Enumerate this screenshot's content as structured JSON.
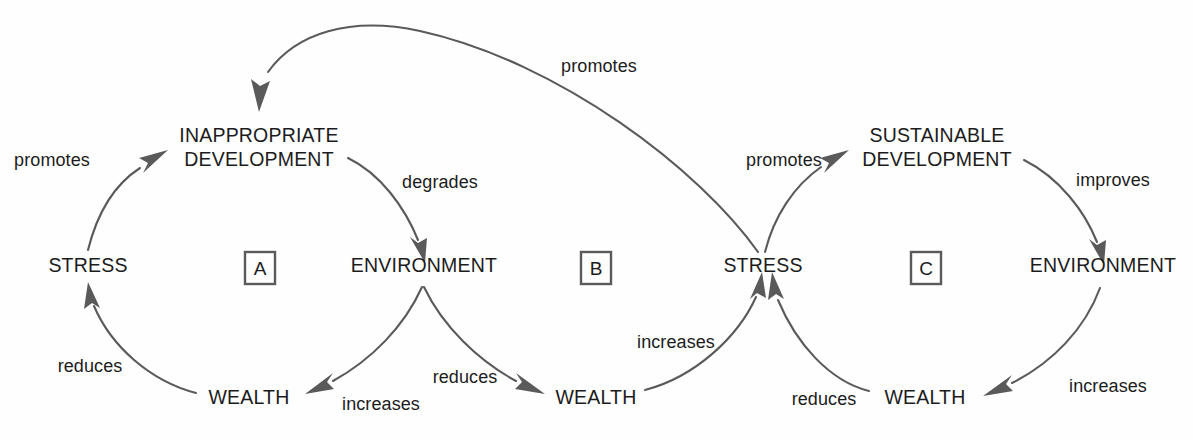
{
  "diagram": {
    "type": "causal-loop-diagram",
    "line_color": "#5a5a5a",
    "text_color": "#1c1c1c",
    "background_color": "#fefefe"
  },
  "nodes": {
    "stress_left": "STRESS",
    "inappropriate_development_line1": "INAPPROPRIATE",
    "inappropriate_development_line2": "DEVELOPMENT",
    "environment_left": "ENVIRONMENT",
    "wealth_left": "WEALTH",
    "wealth_middle": "WEALTH",
    "stress_middle": "STRESS",
    "sustainable_development_line1": "SUSTAINABLE",
    "sustainable_development_line2": "DEVELOPMENT",
    "environment_right": "ENVIRONMENT",
    "wealth_right": "WEALTH"
  },
  "loops": {
    "a": "A",
    "b": "B",
    "c": "C"
  },
  "edges": {
    "stress_left_to_inappropriate": "promotes",
    "inappropriate_to_environment_left": "degrades",
    "environment_left_to_wealth_left": "increases",
    "wealth_left_to_stress_left": "reduces",
    "environment_left_to_wealth_middle": "reduces",
    "wealth_middle_to_stress_middle": "increases",
    "stress_middle_to_inappropriate": "promotes",
    "stress_middle_to_sustainable": "promotes",
    "sustainable_to_environment_right": "improves",
    "environment_right_to_wealth_right": "increases",
    "wealth_right_to_stress_middle": "reduces"
  }
}
